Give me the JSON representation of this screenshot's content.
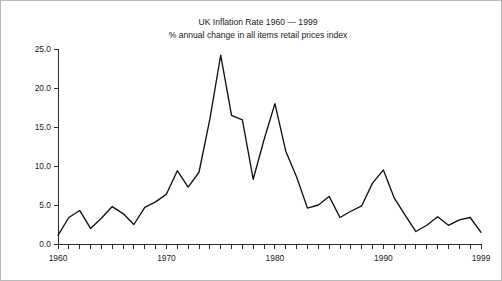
{
  "figure": {
    "title_line1": "UK Inflation Rate 1960 — 1999",
    "title_line2": "% annual change in all items retail prices index",
    "border_color": "#b9b9b9",
    "line_color": "#111111",
    "background": "#ffffff"
  },
  "chart_data": {
    "type": "line",
    "title": "UK Inflation Rate 1960 — 1999",
    "subtitle": "% annual change in all items retail prices index",
    "xlabel": "",
    "ylabel": "",
    "xlim": [
      1960,
      1999
    ],
    "ylim": [
      0.0,
      25.0
    ],
    "grid": false,
    "legend": "none",
    "y_ticks": [
      0.0,
      5.0,
      10.0,
      15.0,
      20.0,
      25.0
    ],
    "y_tick_labels": [
      "0.0",
      "5.0",
      "10.0",
      "15.0",
      "20.0",
      "25.0"
    ],
    "x_ticks": [
      1960,
      1961,
      1962,
      1963,
      1964,
      1965,
      1966,
      1967,
      1968,
      1969,
      1970,
      1971,
      1972,
      1973,
      1974,
      1975,
      1976,
      1977,
      1978,
      1979,
      1980,
      1981,
      1982,
      1983,
      1984,
      1985,
      1986,
      1987,
      1988,
      1989,
      1990,
      1991,
      1992,
      1993,
      1994,
      1995,
      1996,
      1997,
      1998,
      1999
    ],
    "x_tick_labels": [
      {
        "value": 1960,
        "label": "1960"
      },
      {
        "value": 1970,
        "label": "1970"
      },
      {
        "value": 1980,
        "label": "1980"
      },
      {
        "value": 1990,
        "label": "1990"
      },
      {
        "value": 1999,
        "label": "1999"
      }
    ],
    "x": [
      1960,
      1961,
      1962,
      1963,
      1964,
      1965,
      1966,
      1967,
      1968,
      1969,
      1970,
      1971,
      1972,
      1973,
      1974,
      1975,
      1976,
      1977,
      1978,
      1979,
      1980,
      1981,
      1982,
      1983,
      1984,
      1985,
      1986,
      1987,
      1988,
      1989,
      1990,
      1991,
      1992,
      1993,
      1994,
      1995,
      1996,
      1997,
      1998,
      1999
    ],
    "values": [
      1.1,
      3.4,
      4.3,
      2.0,
      3.3,
      4.8,
      3.9,
      2.5,
      4.7,
      5.4,
      6.4,
      9.4,
      7.3,
      9.2,
      16.0,
      24.2,
      16.5,
      15.9,
      8.3,
      13.4,
      18.0,
      11.9,
      8.6,
      4.6,
      5.0,
      6.1,
      3.4,
      4.2,
      4.9,
      7.8,
      9.5,
      5.9,
      3.7,
      1.6,
      2.4,
      3.5,
      2.4,
      3.1,
      3.4,
      1.5
    ]
  }
}
